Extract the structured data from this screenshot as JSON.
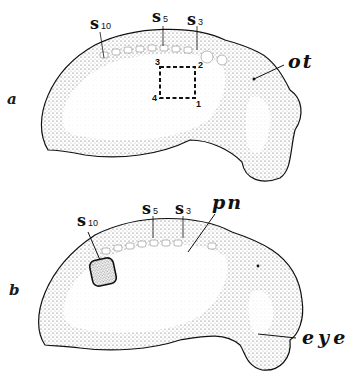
{
  "figure": {
    "panels": [
      {
        "label": "a",
        "somite_labels": [
          {
            "letter": "s",
            "number": "10"
          },
          {
            "letter": "s",
            "number": "5"
          },
          {
            "letter": "s",
            "number": "3"
          }
        ],
        "annotations": [
          {
            "text": "ot"
          }
        ],
        "graft_square_corners": [
          "3",
          "2",
          "4",
          "1"
        ]
      },
      {
        "label": "b",
        "somite_labels": [
          {
            "letter": "s",
            "number": "10"
          },
          {
            "letter": "s",
            "number": "5"
          },
          {
            "letter": "s",
            "number": "3"
          }
        ],
        "annotations": [
          {
            "text": "pn"
          },
          {
            "text": "eye"
          }
        ]
      }
    ],
    "colors": {
      "ink": "#111111",
      "stipple": "#555555",
      "background": "#ffffff"
    }
  }
}
